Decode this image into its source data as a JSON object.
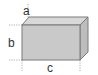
{
  "diagram": {
    "type": "cuboid-dimensions",
    "labels": {
      "depth": "a",
      "height": "b",
      "length": "c"
    },
    "colors": {
      "front_face": "#c9c9c9",
      "top_face": "#d8d8d8",
      "side_face": "#bdbdbd",
      "edge": "#7a7a7a",
      "guide": "#9a9a9a",
      "text": "#333333"
    }
  }
}
